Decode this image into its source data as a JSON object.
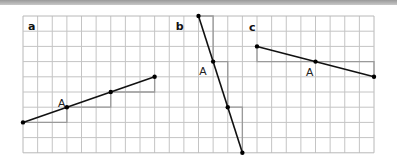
{
  "figure": {
    "grid": {
      "cols": 24,
      "rows": 9,
      "origin_px": [
        23,
        16
      ],
      "cell_w": 14.625,
      "cell_h": 15.2,
      "line_color": "#c4c4c4",
      "border_color": "#b8b8b8"
    },
    "colors": {
      "line": "#111111",
      "step": "#9a9a9a",
      "point": "#000000"
    },
    "panels": [
      {
        "label": "a",
        "label_pos": [
          0.35,
          0.65
        ],
        "points": [
          [
            0,
            7
          ],
          [
            3,
            6
          ],
          [
            6,
            5
          ],
          [
            9,
            4
          ]
        ],
        "point_label": "A",
        "point_label_pos": [
          2.4,
          5.7
        ],
        "steps": [
          [
            [
              0,
              7
            ],
            [
              3,
              7
            ],
            [
              3,
              6
            ]
          ],
          [
            [
              3,
              6
            ],
            [
              6,
              6
            ],
            [
              6,
              5
            ]
          ],
          [
            [
              6,
              5
            ],
            [
              9,
              5
            ],
            [
              9,
              4
            ]
          ]
        ]
      },
      {
        "label": "b",
        "label_pos": [
          10.45,
          0.65
        ],
        "points": [
          [
            12,
            0
          ],
          [
            13,
            3
          ],
          [
            14,
            6
          ],
          [
            15,
            9
          ]
        ],
        "point_label": "A",
        "point_label_pos": [
          12.05,
          3.65
        ],
        "steps": [
          [
            [
              12,
              0
            ],
            [
              13,
              0
            ],
            [
              13,
              3
            ]
          ],
          [
            [
              13,
              3
            ],
            [
              14,
              3
            ],
            [
              14,
              6
            ]
          ],
          [
            [
              14,
              6
            ],
            [
              15,
              6
            ],
            [
              15,
              9
            ]
          ]
        ]
      },
      {
        "label": "c",
        "label_pos": [
          15.45,
          0.75
        ],
        "points": [
          [
            16,
            2
          ],
          [
            20,
            3
          ],
          [
            24,
            4
          ]
        ],
        "point_label": "A",
        "point_label_pos": [
          19.35,
          3.7
        ],
        "steps": [
          [
            [
              16,
              2
            ],
            [
              16,
              3
            ],
            [
              20,
              3
            ]
          ],
          [
            [
              20,
              3
            ],
            [
              24,
              3
            ],
            [
              24,
              4
            ]
          ]
        ]
      }
    ]
  }
}
